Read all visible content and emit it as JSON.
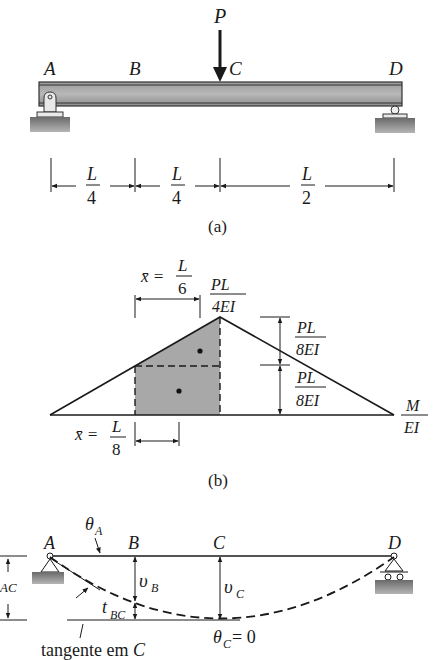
{
  "figure_a": {
    "caption": "(a)",
    "load_label": "P",
    "points": [
      "A",
      "B",
      "C",
      "D"
    ],
    "dims": [
      {
        "num": "L",
        "den": "4"
      },
      {
        "num": "L",
        "den": "4"
      },
      {
        "num": "L",
        "den": "2"
      }
    ]
  },
  "figure_b": {
    "caption": "(b)",
    "peak": {
      "num": "PL",
      "den": "4EI"
    },
    "upper_part": {
      "num": "PL",
      "den": "8EI"
    },
    "lower_part": {
      "num": "PL",
      "den": "8EI"
    },
    "axis": {
      "num": "M",
      "den": "EI"
    },
    "xbar_top": {
      "lhs": "x̄ =",
      "num": "L",
      "den": "6"
    },
    "xbar_bottom": {
      "lhs": "x̄ =",
      "num": "L",
      "den": "8"
    }
  },
  "figure_c": {
    "points": [
      "A",
      "B",
      "C",
      "D"
    ],
    "theta_A": "θ",
    "theta_A_sub": "A",
    "v_B": "υ",
    "v_B_sub": "B",
    "v_C": "υ",
    "v_C_sub": "C",
    "t_BC": "t",
    "t_BC_sub": "BC",
    "t_AC_partial": "AC",
    "theta_C": "θ",
    "theta_C_sub": "C",
    "theta_C_val": " = 0",
    "tangent_label": "tangente em ",
    "tangent_point": "C"
  }
}
